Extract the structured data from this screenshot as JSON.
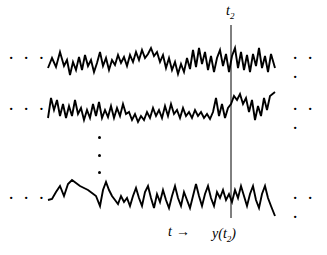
{
  "figure": {
    "name": "ensemble-of-random-process-realizations",
    "background_color": "#ffffff",
    "stroke_color": "#000000",
    "width": 327,
    "height": 255
  },
  "labels": {
    "time_slice_top": "t",
    "time_slice_top_sub": "2",
    "time_axis": "t",
    "time_axis_arrow": "→",
    "sample_value": "y(t",
    "sample_value_sub": "2",
    "sample_value_tail": ")"
  },
  "ellipses": {
    "left": "· · ·",
    "right": "· · ·",
    "vertical_dot_count": 3
  },
  "marker_line": {
    "x": 231,
    "y_top": 25,
    "y_bottom": 218,
    "width": 1,
    "color": "#000000"
  },
  "chart_data": {
    "type": "line",
    "title": "",
    "xlabel": "t",
    "ylabel": "",
    "grid": false,
    "legend": "none",
    "x_range": [
      48,
      275
    ],
    "annotations": [
      {
        "text": "t2",
        "x": 231,
        "y": 12,
        "role": "slice-time-label"
      },
      {
        "text": "y(t2)",
        "x": 231,
        "y": 234,
        "role": "slice-value-label"
      },
      {
        "text": "t →",
        "x": 175,
        "y": 231,
        "role": "axis-direction-label"
      }
    ],
    "series": [
      {
        "name": "realization-1",
        "baseline_y": 62,
        "points": [
          [
            48,
            68
          ],
          [
            52,
            58
          ],
          [
            56,
            67
          ],
          [
            60,
            52
          ],
          [
            64,
            66
          ],
          [
            67,
            60
          ],
          [
            70,
            75
          ],
          [
            73,
            62
          ],
          [
            76,
            70
          ],
          [
            79,
            57
          ],
          [
            82,
            70
          ],
          [
            85,
            55
          ],
          [
            88,
            66
          ],
          [
            91,
            60
          ],
          [
            94,
            72
          ],
          [
            97,
            63
          ],
          [
            100,
            52
          ],
          [
            103,
            66
          ],
          [
            106,
            58
          ],
          [
            109,
            70
          ],
          [
            112,
            60
          ],
          [
            115,
            65
          ],
          [
            118,
            55
          ],
          [
            121,
            63
          ],
          [
            124,
            57
          ],
          [
            127,
            66
          ],
          [
            130,
            55
          ],
          [
            133,
            62
          ],
          [
            136,
            52
          ],
          [
            139,
            60
          ],
          [
            142,
            50
          ],
          [
            145,
            58
          ],
          [
            148,
            54
          ],
          [
            151,
            48
          ],
          [
            154,
            56
          ],
          [
            157,
            52
          ],
          [
            160,
            62
          ],
          [
            163,
            55
          ],
          [
            166,
            68
          ],
          [
            169,
            58
          ],
          [
            172,
            70
          ],
          [
            175,
            62
          ],
          [
            178,
            74
          ],
          [
            181,
            64
          ],
          [
            184,
            72
          ],
          [
            187,
            58
          ],
          [
            190,
            69
          ],
          [
            193,
            50
          ],
          [
            196,
            67
          ],
          [
            199,
            48
          ],
          [
            202,
            64
          ],
          [
            205,
            52
          ],
          [
            208,
            70
          ],
          [
            211,
            56
          ],
          [
            214,
            72
          ],
          [
            217,
            58
          ],
          [
            220,
            50
          ],
          [
            223,
            66
          ],
          [
            226,
            54
          ],
          [
            229,
            72
          ],
          [
            232,
            56
          ],
          [
            235,
            48
          ],
          [
            238,
            68
          ],
          [
            241,
            52
          ],
          [
            244,
            70
          ],
          [
            247,
            55
          ],
          [
            250,
            72
          ],
          [
            253,
            54
          ],
          [
            256,
            66
          ],
          [
            259,
            48
          ],
          [
            262,
            68
          ],
          [
            265,
            56
          ],
          [
            268,
            72
          ],
          [
            271,
            54
          ],
          [
            275,
            68
          ]
        ]
      },
      {
        "name": "realization-2",
        "baseline_y": 110,
        "points": [
          [
            48,
            118
          ],
          [
            51,
            98
          ],
          [
            54,
            110
          ],
          [
            57,
            100
          ],
          [
            60,
            116
          ],
          [
            63,
            104
          ],
          [
            66,
            118
          ],
          [
            69,
            106
          ],
          [
            72,
            116
          ],
          [
            75,
            100
          ],
          [
            78,
            114
          ],
          [
            81,
            108
          ],
          [
            84,
            120
          ],
          [
            87,
            110
          ],
          [
            90,
            118
          ],
          [
            93,
            104
          ],
          [
            96,
            116
          ],
          [
            99,
            102
          ],
          [
            102,
            118
          ],
          [
            105,
            110
          ],
          [
            108,
            117
          ],
          [
            111,
            106
          ],
          [
            114,
            118
          ],
          [
            117,
            108
          ],
          [
            120,
            116
          ],
          [
            123,
            104
          ],
          [
            126,
            114
          ],
          [
            129,
            112
          ],
          [
            132,
            120
          ],
          [
            135,
            114
          ],
          [
            138,
            122
          ],
          [
            141,
            116
          ],
          [
            144,
            120
          ],
          [
            147,
            112
          ],
          [
            150,
            118
          ],
          [
            153,
            108
          ],
          [
            156,
            116
          ],
          [
            159,
            110
          ],
          [
            162,
            118
          ],
          [
            165,
            106
          ],
          [
            168,
            116
          ],
          [
            171,
            104
          ],
          [
            174,
            114
          ],
          [
            177,
            110
          ],
          [
            180,
            118
          ],
          [
            183,
            108
          ],
          [
            186,
            116
          ],
          [
            189,
            112
          ],
          [
            192,
            118
          ],
          [
            195,
            110
          ],
          [
            198,
            116
          ],
          [
            201,
            112
          ],
          [
            204,
            118
          ],
          [
            207,
            114
          ],
          [
            210,
            119
          ],
          [
            213,
            112
          ],
          [
            216,
            98
          ],
          [
            219,
            116
          ],
          [
            222,
            104
          ],
          [
            225,
            118
          ],
          [
            228,
            108
          ],
          [
            231,
            104
          ],
          [
            234,
            96
          ],
          [
            237,
            100
          ],
          [
            240,
            94
          ],
          [
            243,
            104
          ],
          [
            246,
            98
          ],
          [
            249,
            112
          ],
          [
            252,
            100
          ],
          [
            255,
            120
          ],
          [
            258,
            106
          ],
          [
            261,
            116
          ],
          [
            264,
            98
          ],
          [
            267,
            110
          ],
          [
            270,
            96
          ],
          [
            275,
            92
          ]
        ]
      },
      {
        "name": "realization-n",
        "baseline_y": 196,
        "points": [
          [
            48,
            200
          ],
          [
            52,
            199
          ],
          [
            56,
            192
          ],
          [
            60,
            186
          ],
          [
            64,
            196
          ],
          [
            68,
            184
          ],
          [
            72,
            180
          ],
          [
            76,
            183
          ],
          [
            80,
            186
          ],
          [
            84,
            188
          ],
          [
            88,
            190
          ],
          [
            92,
            193
          ],
          [
            96,
            196
          ],
          [
            100,
            206
          ],
          [
            103,
            190
          ],
          [
            106,
            182
          ],
          [
            109,
            190
          ],
          [
            112,
            196
          ],
          [
            115,
            200
          ],
          [
            118,
            204
          ],
          [
            121,
            196
          ],
          [
            124,
            202
          ],
          [
            127,
            198
          ],
          [
            130,
            206
          ],
          [
            133,
            196
          ],
          [
            136,
            188
          ],
          [
            139,
            198
          ],
          [
            142,
            206
          ],
          [
            145,
            192
          ],
          [
            148,
            186
          ],
          [
            151,
            198
          ],
          [
            154,
            208
          ],
          [
            157,
            194
          ],
          [
            160,
            202
          ],
          [
            163,
            190
          ],
          [
            166,
            200
          ],
          [
            169,
            208
          ],
          [
            172,
            196
          ],
          [
            175,
            186
          ],
          [
            178,
            198
          ],
          [
            181,
            206
          ],
          [
            184,
            192
          ],
          [
            187,
            200
          ],
          [
            190,
            208
          ],
          [
            193,
            196
          ],
          [
            196,
            184
          ],
          [
            199,
            196
          ],
          [
            202,
            206
          ],
          [
            205,
            194
          ],
          [
            208,
            186
          ],
          [
            211,
            198
          ],
          [
            214,
            206
          ],
          [
            217,
            192
          ],
          [
            220,
            198
          ],
          [
            223,
            190
          ],
          [
            226,
            200
          ],
          [
            229,
            194
          ],
          [
            232,
            202
          ],
          [
            235,
            190
          ],
          [
            238,
            198
          ],
          [
            241,
            186
          ],
          [
            244,
            196
          ],
          [
            247,
            206
          ],
          [
            250,
            194
          ],
          [
            253,
            186
          ],
          [
            256,
            200
          ],
          [
            259,
            208
          ],
          [
            262,
            194
          ],
          [
            265,
            186
          ],
          [
            268,
            198
          ],
          [
            271,
            206
          ],
          [
            275,
            216
          ]
        ]
      }
    ]
  }
}
